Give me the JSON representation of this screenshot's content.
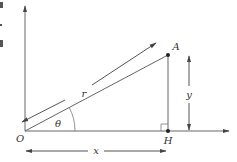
{
  "diagram": {
    "type": "polar-coordinates-right-triangle",
    "labels": {
      "origin": "O",
      "point": "A",
      "foot": "H",
      "radius": "r",
      "angle": "θ",
      "horizontal": "x",
      "vertical": "y"
    },
    "colors": {
      "line": "#555555",
      "text": "#333333",
      "background": "#ffffff"
    }
  }
}
